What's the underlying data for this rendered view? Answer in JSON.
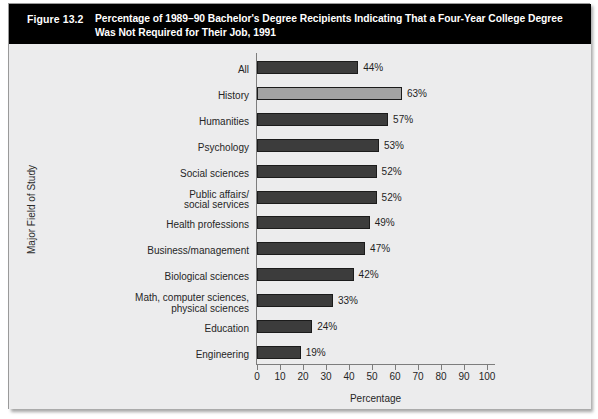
{
  "figure": {
    "number_label": "Figure 13.2",
    "title": "Percentage of 1989–90 Bachelor's Degree Recipients Indicating That a Four-Year College Degree Was Not Required for Their Job, 1991"
  },
  "chart_data": {
    "type": "bar",
    "orientation": "horizontal",
    "title": "Percentage of 1989–90 Bachelor's Degree Recipients Indicating That a Four-Year College Degree Was Not Required for Their Job, 1991",
    "xlabel": "Percentage",
    "ylabel": "Major Field of Study",
    "xlim": [
      0,
      100
    ],
    "xticks": [
      0,
      10,
      20,
      30,
      40,
      50,
      60,
      70,
      80,
      90,
      100
    ],
    "xtick_labels": [
      "0",
      "10",
      "20",
      "30",
      "40",
      "50",
      "60",
      "70",
      "80",
      "90",
      "100"
    ],
    "grid": false,
    "legend": null,
    "categories": [
      "All",
      "History",
      "Humanities",
      "Psychology",
      "Social sciences",
      "Public affairs/\nsocial services",
      "Health professions",
      "Business/management",
      "Biological sciences",
      "Math, computer sciences,\nphysical sciences",
      "Education",
      "Engineering"
    ],
    "values": [
      44,
      63,
      57,
      53,
      52,
      52,
      49,
      47,
      42,
      33,
      24,
      19
    ],
    "value_labels": [
      "44%",
      "63%",
      "57%",
      "53%",
      "52%",
      "52%",
      "49%",
      "47%",
      "42%",
      "33%",
      "24%",
      "19%"
    ],
    "highlight_index": 1,
    "colors": {
      "bar_default": "#3c3c3c",
      "bar_highlight": "#a3a3a3",
      "bar_outline": "#1b1b1b",
      "header_background": "#000000",
      "header_text": "#ffffff",
      "panel_background": "#ececed",
      "axis": "#7d7d7d",
      "text": "#262626"
    }
  }
}
